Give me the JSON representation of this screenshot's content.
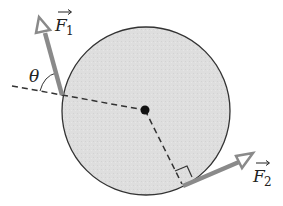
{
  "diagram": {
    "type": "torque-forces-on-disk",
    "colors": {
      "background": "#ffffff",
      "disk_fill": "#dcdcdc",
      "disk_stroke": "#333333",
      "force_arrow": "#8a8a8a",
      "dashed_line": "#333333",
      "center_dot": "#111111"
    },
    "disk": {
      "cx": 146,
      "cy": 111,
      "r": 84
    },
    "center": {
      "x": 145,
      "y": 110
    },
    "forces": [
      {
        "name": "F1",
        "symbol": "F",
        "subscript": "1",
        "from": {
          "x": 62,
          "y": 95
        },
        "to": {
          "x": 42,
          "y": 22
        },
        "label_pos": {
          "x": 55,
          "y": 30
        }
      },
      {
        "name": "F2",
        "symbol": "F",
        "subscript": "2",
        "from": {
          "x": 183,
          "y": 186
        },
        "to": {
          "x": 251,
          "y": 157
        },
        "label_pos": {
          "x": 253,
          "y": 183
        }
      }
    ],
    "angle": {
      "symbol": "θ",
      "label_pos": {
        "x": 28,
        "y": 82
      }
    },
    "right_angle_marker": true
  }
}
